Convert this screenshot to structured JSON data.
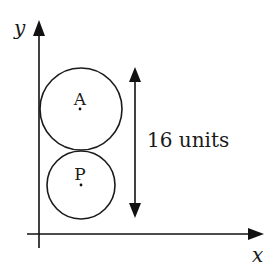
{
  "diagram": {
    "axes": {
      "x_label": "x",
      "y_label": "y"
    },
    "circles": [
      {
        "label": "A",
        "position": "upper",
        "relative_size": "larger"
      },
      {
        "label": "P",
        "position": "lower",
        "relative_size": "smaller"
      }
    ],
    "dimension": {
      "label": "16 units",
      "orientation": "vertical",
      "spans": "combined height of circles A and P"
    },
    "colors": {
      "stroke": "#111111",
      "background": "#ffffff"
    }
  }
}
